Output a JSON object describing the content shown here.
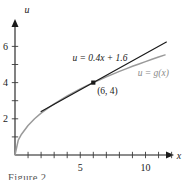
{
  "figure": {
    "caption": "Figure 2",
    "background_color": "#ffffff"
  },
  "chart_data": {
    "type": "line",
    "title": "",
    "xlabel": "x",
    "ylabel": "u",
    "xlim": [
      0,
      12.6
    ],
    "ylim": [
      0,
      6.9
    ],
    "grid": false,
    "legend_position": "inline-annotation",
    "x_tick_values": [
      1,
      2,
      3,
      4,
      5,
      6,
      7,
      8,
      9,
      10,
      11,
      12
    ],
    "x_tick_labels": [
      "",
      "",
      "",
      "",
      "5",
      "",
      "",
      "",
      "",
      "10",
      "",
      ""
    ],
    "y_tick_values": [
      1,
      2,
      3,
      4,
      5,
      6
    ],
    "y_tick_labels": [
      "",
      "2",
      "",
      "4",
      "",
      "6"
    ],
    "series": [
      {
        "name": "u = g(x)",
        "type": "curve",
        "color": "#9a9a9a",
        "x": [
          0,
          0.25,
          0.5,
          1,
          1.5,
          2,
          2.5,
          3,
          3.5,
          4,
          4.5,
          5,
          5.5,
          6,
          6.5,
          7,
          7.5,
          8,
          8.5,
          9,
          9.5,
          10,
          10.5,
          11,
          11.5
        ],
        "values": [
          0,
          0.82,
          1.15,
          1.63,
          2.0,
          2.31,
          2.58,
          2.83,
          3.05,
          3.26,
          3.46,
          3.65,
          3.83,
          4.0,
          4.16,
          4.32,
          4.47,
          4.62,
          4.76,
          4.9,
          5.03,
          5.16,
          5.29,
          5.41,
          5.53
        ]
      },
      {
        "name": "u = 0.4x + 1.6",
        "type": "tangent-line",
        "color": "#1a1a1a",
        "slope": 0.4,
        "intercept": 1.6,
        "x": [
          2.0,
          11.6
        ],
        "values": [
          2.4,
          6.24
        ]
      }
    ],
    "annotations": [
      {
        "name": "tangent-equation",
        "text": "u = 0.4x + 1.6",
        "x": 4.4,
        "y": 5.2,
        "color": "#1a1a1a"
      },
      {
        "name": "curve-equation",
        "text": "u = g(x)",
        "x": 9.4,
        "y": 4.35,
        "color": "#8a8a8a"
      },
      {
        "name": "point-coordinates",
        "text": "(6, 4)",
        "x": 6.3,
        "y": 3.35,
        "color": "#1a1a1a"
      }
    ],
    "points": [
      {
        "name": "tangency-point",
        "label": "(6, 4)",
        "x": 6,
        "y": 4,
        "color": "#1a1a1a"
      }
    ]
  }
}
